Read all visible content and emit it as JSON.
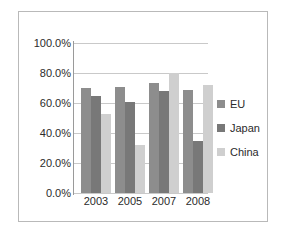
{
  "chart_data": {
    "type": "bar",
    "title": "",
    "xlabel": "",
    "ylabel": "",
    "categories": [
      "2003",
      "2005",
      "2007",
      "2008"
    ],
    "series": [
      {
        "name": "EU",
        "color": "#8d8d8d",
        "values": [
          70.0,
          70.5,
          73.5,
          69.0
        ]
      },
      {
        "name": "Japan",
        "color": "#787878",
        "values": [
          65.0,
          61.0,
          68.0,
          35.0
        ]
      },
      {
        "name": "China",
        "color": "#cfcfcf",
        "values": [
          53.0,
          32.0,
          80.0,
          72.0
        ]
      }
    ],
    "ylim": [
      0,
      100
    ],
    "y_ticks": [
      "0.0%",
      "20.0%",
      "40.0%",
      "60.0%",
      "80.0%",
      "100.0%"
    ],
    "y_tick_values": [
      0,
      20,
      40,
      60,
      80,
      100
    ],
    "grid": true,
    "legend_position": "right"
  },
  "legend": {
    "items": [
      {
        "label": "EU"
      },
      {
        "label": "Japan"
      },
      {
        "label": "China"
      }
    ]
  }
}
